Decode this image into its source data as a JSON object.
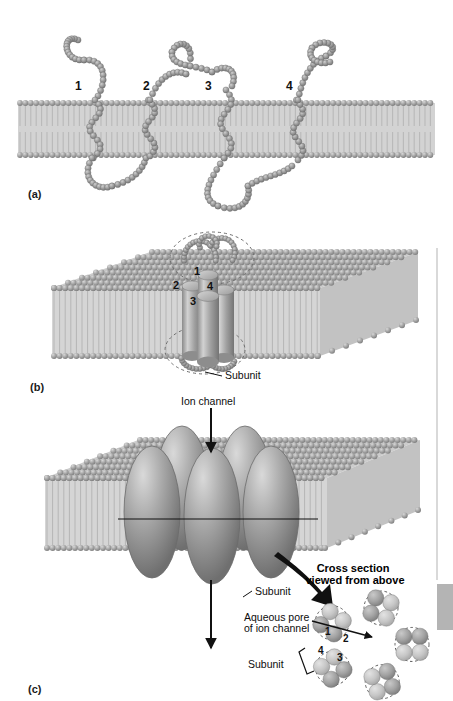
{
  "figure": {
    "panels": [
      {
        "id": "a",
        "label": "(a)",
        "description": "Single subunit polypeptide with four membrane-spanning segments"
      },
      {
        "id": "b",
        "label": "(b)",
        "description": "Four transmembrane helices bundled as one subunit"
      },
      {
        "id": "c",
        "label": "(c)",
        "description": "Five subunits assembled into a complete ion channel"
      }
    ]
  },
  "panel_a": {
    "label": "(a)",
    "helix_numbers": [
      "1",
      "2",
      "3",
      "4"
    ]
  },
  "panel_b": {
    "label": "(b)",
    "helix_numbers": [
      "1",
      "2",
      "4",
      "3"
    ],
    "subunit_label": "Subunit"
  },
  "panel_c": {
    "label": "(c)",
    "ion_channel_label": "Ion channel",
    "subunit_label": "Subunit",
    "aqueous_pore_label_line1": "Aqueous pore",
    "aqueous_pore_label_line2": "of ion channel",
    "cross_section_label_line1": "Cross section",
    "cross_section_label_line2": "viewed from above",
    "inset_subunit_label": "Subunit",
    "inset_helix_numbers": [
      "1",
      "2",
      "4",
      "3"
    ],
    "subunit_count": 5
  },
  "colors": {
    "background": "#ffffff",
    "membrane_head": "#9a9a9a",
    "membrane_head_light": "#c4c4c4",
    "membrane_tail": "#d6d6d6",
    "membrane_core": "#cfcfcf",
    "protein_bead": "#8f8f8f",
    "protein_bead_light": "#b5b5b5",
    "helix_cylinder": "#9d9d9d",
    "subunit_body": "#9a9a9a",
    "subunit_highlight": "#d2d2d2",
    "arrow": "#111111",
    "text": "#0d0d0d",
    "rule": "#c9c9c9"
  }
}
